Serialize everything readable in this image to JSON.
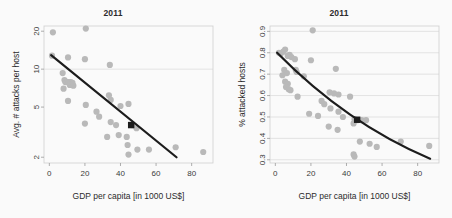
{
  "figure": {
    "background": "#fafafa",
    "point_color": "#b9b9b9",
    "line_color": "#1c1c1c",
    "grid_color": "#d9d9d9"
  },
  "panels": [
    {
      "name": "attacks-per-host",
      "title": "2011",
      "xlabel": "GDP per capita [in 1000 US$]",
      "ylabel": "Avg. # attacks per host"
    },
    {
      "name": "attacked-hosts",
      "title": "2011",
      "xlabel": "GDP per capita [in 1000 US$]",
      "ylabel": "% attacked hosts"
    }
  ],
  "chart_data": [
    {
      "type": "scatter",
      "title": "2011",
      "xlabel": "GDP per capita [in 1000 US$]",
      "ylabel": "Avg. # attacks per host",
      "xlim": [
        -3,
        92
      ],
      "ylim": [
        1.8,
        22
      ],
      "yscale": "log",
      "xticks": [
        0,
        20,
        40,
        60,
        80
      ],
      "yticks": [
        2,
        5,
        10,
        20
      ],
      "xticklabels": [
        "0",
        "20",
        "40",
        "60",
        "80"
      ],
      "yticklabels": [
        "2",
        "5",
        "10",
        "20"
      ],
      "grid": "horizontal-at-10",
      "legend": "none",
      "points": [
        [
          2.0,
          19.6
        ],
        [
          20.5,
          21.0
        ],
        [
          1.5,
          12.8
        ],
        [
          10.5,
          12.4
        ],
        [
          20.0,
          12.0
        ],
        [
          34.0,
          10.8
        ],
        [
          7.5,
          9.3
        ],
        [
          8.5,
          8.2
        ],
        [
          9.0,
          7.9
        ],
        [
          10.0,
          7.9
        ],
        [
          11.0,
          7.9
        ],
        [
          12.0,
          7.9
        ],
        [
          13.0,
          7.8
        ],
        [
          8.0,
          7.0
        ],
        [
          11.5,
          7.5
        ],
        [
          13.5,
          7.4
        ],
        [
          10.5,
          5.6
        ],
        [
          20.5,
          5.2
        ],
        [
          33.5,
          6.2
        ],
        [
          34.5,
          5.7
        ],
        [
          40.0,
          5.1
        ],
        [
          44.5,
          5.3
        ],
        [
          26.5,
          4.6
        ],
        [
          28.0,
          4.2
        ],
        [
          20.0,
          3.7
        ],
        [
          34.5,
          3.8
        ],
        [
          37.5,
          3.6
        ],
        [
          46.5,
          3.6
        ],
        [
          49.0,
          3.4
        ],
        [
          32.5,
          2.9
        ],
        [
          39.0,
          3.0
        ],
        [
          43.5,
          2.9
        ],
        [
          44.0,
          2.5
        ],
        [
          44.5,
          2.1
        ],
        [
          49.5,
          2.3
        ],
        [
          56.0,
          2.3
        ],
        [
          71.0,
          2.4
        ],
        [
          86.5,
          2.2
        ]
      ],
      "fit_line": {
        "x_start": 1.0,
        "y_start": 12.9,
        "x_end": 71.5,
        "y_end": 2.0
      },
      "highlight_marker": {
        "x": 46.0,
        "y": 3.6
      }
    },
    {
      "type": "scatter",
      "title": "2011",
      "xlabel": "GDP per capita [in 1000 US$]",
      "ylabel": "% attacked hosts",
      "xlim": [
        -3,
        92
      ],
      "ylim": [
        0.285,
        0.925
      ],
      "yscale": "linear",
      "xticks": [
        0,
        20,
        40,
        60,
        80
      ],
      "yticks": [
        0.3,
        0.4,
        0.5,
        0.6,
        0.7,
        0.8,
        0.9
      ],
      "xticklabels": [
        "0",
        "20",
        "40",
        "60",
        "80"
      ],
      "yticklabels": [
        "0.3",
        "0.4",
        "0.5",
        "0.6",
        "0.7",
        "0.8",
        "0.9"
      ],
      "grid": "horizontal",
      "legend": "none",
      "points": [
        [
          21.0,
          0.905
        ],
        [
          2.0,
          0.8
        ],
        [
          3.0,
          0.795
        ],
        [
          5.5,
          0.815
        ],
        [
          4.5,
          0.805
        ],
        [
          7.0,
          0.785
        ],
        [
          8.0,
          0.79
        ],
        [
          9.0,
          0.78
        ],
        [
          11.0,
          0.77
        ],
        [
          20.0,
          0.765
        ],
        [
          5.0,
          0.72
        ],
        [
          6.5,
          0.705
        ],
        [
          4.0,
          0.695
        ],
        [
          11.5,
          0.72
        ],
        [
          12.0,
          0.71
        ],
        [
          16.0,
          0.69
        ],
        [
          34.0,
          0.725
        ],
        [
          5.5,
          0.665
        ],
        [
          7.0,
          0.655
        ],
        [
          6.0,
          0.64
        ],
        [
          7.5,
          0.63
        ],
        [
          8.5,
          0.625
        ],
        [
          12.5,
          0.595
        ],
        [
          30.5,
          0.615
        ],
        [
          33.0,
          0.61
        ],
        [
          35.5,
          0.605
        ],
        [
          42.0,
          0.595
        ],
        [
          26.0,
          0.575
        ],
        [
          27.5,
          0.56
        ],
        [
          19.0,
          0.515
        ],
        [
          31.0,
          0.54
        ],
        [
          35.5,
          0.525
        ],
        [
          24.0,
          0.505
        ],
        [
          38.0,
          0.5
        ],
        [
          44.5,
          0.49
        ],
        [
          46.0,
          0.485
        ],
        [
          48.5,
          0.485
        ],
        [
          51.0,
          0.485
        ],
        [
          30.0,
          0.455
        ],
        [
          35.0,
          0.44
        ],
        [
          44.0,
          0.47
        ],
        [
          47.5,
          0.385
        ],
        [
          53.0,
          0.375
        ],
        [
          57.0,
          0.36
        ],
        [
          44.0,
          0.325
        ],
        [
          44.5,
          0.315
        ],
        [
          70.5,
          0.385
        ],
        [
          86.5,
          0.365
        ]
      ],
      "fit_curve": {
        "x_start": 1.0,
        "y_start": 0.8,
        "x_end": 87.0,
        "y_end": 0.305,
        "control_x": 40.0,
        "control_y": 0.47
      },
      "highlight_marker": {
        "x": 46.0,
        "y": 0.487
      }
    }
  ]
}
